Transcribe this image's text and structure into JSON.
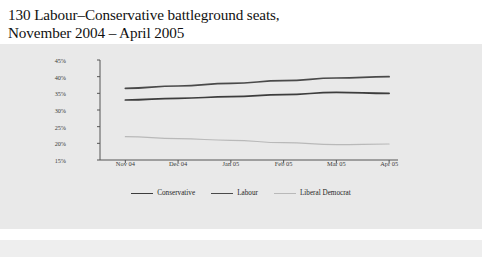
{
  "title": {
    "line1": "130 Labour–Conservative battleground seats,",
    "line2": "November 2004 – April 2005"
  },
  "footnote": "Polls A, E, G, H (see appendix 1)",
  "colors": {
    "conservative": "#3d3d3d",
    "labour": "#4a4a4a",
    "liberal_democrat": "#b9b9b9",
    "panel_background": "#e9e9e9",
    "axis": "#555555",
    "page_background": "#ffffff"
  },
  "legend": {
    "position": "bottom-center",
    "items": [
      {
        "label": "Conservative",
        "color": "#3d3d3d",
        "width": 1.6
      },
      {
        "label": "Labour",
        "color": "#4a4a4a",
        "width": 1.6
      },
      {
        "label": "Liberal Democrat",
        "color": "#b9b9b9",
        "width": 1.1
      }
    ]
  },
  "chart_data": {
    "type": "line",
    "title": "130 Labour–Conservative battleground seats, November 2004 – April 2005",
    "subtitle": "",
    "xlabel": "",
    "ylabel": "",
    "categories": [
      "Nov 04",
      "Dec 04",
      "Jan 05",
      "Feb 05",
      "Mar 05",
      "Apr 05"
    ],
    "ylim": [
      15,
      45
    ],
    "yticks": [
      15,
      20,
      25,
      30,
      35,
      40,
      45
    ],
    "ytick_labels": [
      "15%",
      "20%",
      "25%",
      "30%",
      "35%",
      "40%",
      "45%"
    ],
    "grid": false,
    "legend_position": "bottom",
    "annotations": [
      "Polls A, E, G, H (see appendix 1)"
    ],
    "series": [
      {
        "name": "Conservative",
        "color": "#3d3d3d",
        "values": [
          33.0,
          33.5,
          34.0,
          34.6,
          35.3,
          35.0
        ]
      },
      {
        "name": "Labour",
        "color": "#4a4a4a",
        "values": [
          36.5,
          37.2,
          38.0,
          38.8,
          39.6,
          40.0
        ]
      },
      {
        "name": "Liberal Democrat",
        "color": "#b9b9b9",
        "values": [
          22.0,
          21.4,
          20.9,
          20.2,
          19.6,
          19.8
        ]
      }
    ]
  }
}
